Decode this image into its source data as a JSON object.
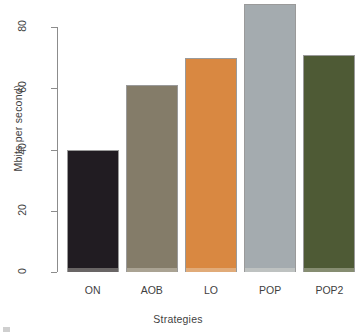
{
  "chart_data": {
    "type": "bar",
    "title": "",
    "subtitle": "",
    "xlabel": "Strategies",
    "ylabel": "Mbits per second)",
    "categories": [
      "ON",
      "AOB",
      "LO",
      "POP",
      "POP2"
    ],
    "values": [
      40,
      61,
      70,
      87.5,
      71
    ],
    "series": [
      {
        "name": "Mbits per second",
        "values": [
          40,
          61,
          70,
          87.5,
          71
        ]
      }
    ],
    "bar_colors": [
      "#211c22",
      "#847c69",
      "#d98841",
      "#a4abaf",
      "#4e5a35"
    ],
    "bar_border_color": "#9a9a9a",
    "ylim": [
      0,
      88
    ],
    "yticks": [
      0,
      20,
      40,
      60,
      80
    ],
    "ytick_labels": [
      "0",
      "20",
      "40",
      "60",
      "80"
    ],
    "axis_color": "#8c8c8c",
    "grid": false,
    "legend": false,
    "legend_position": "none",
    "background": "#ffffff"
  },
  "axes": {
    "y_title": "Mbits per second)",
    "x_title": "Strategies"
  }
}
